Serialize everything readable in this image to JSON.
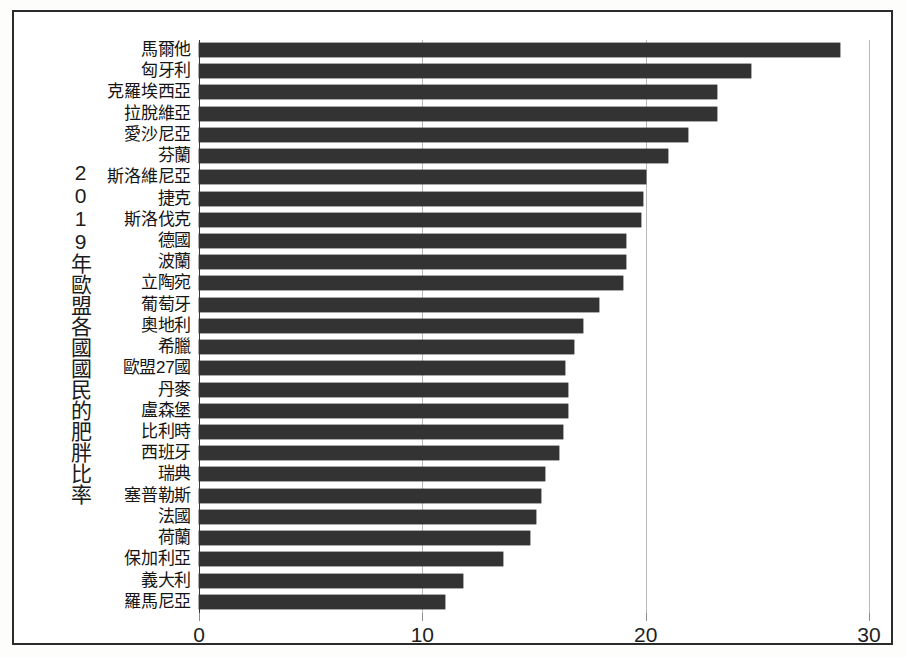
{
  "chart_data": {
    "type": "bar",
    "orientation": "horizontal",
    "title": "",
    "ylabel": "2019年歐盟各國國民的肥胖比率",
    "xlabel": "",
    "xlim": [
      0,
      30
    ],
    "xticks": [
      0,
      10,
      20,
      30
    ],
    "xtick_labels": [
      "0",
      "10",
      "20",
      "30"
    ],
    "grid": true,
    "grid_axis": "x",
    "legend": false,
    "bar_color": "#333333",
    "categories": [
      "馬爾他",
      "匈牙利",
      "克羅埃西亞",
      "拉脫維亞",
      "愛沙尼亞",
      "芬蘭",
      "斯洛維尼亞",
      "捷克",
      "斯洛伐克",
      "德國",
      "波蘭",
      "立陶宛",
      "葡萄牙",
      "奧地利",
      "希臘",
      "歐盟27國",
      "丹麥",
      "盧森堡",
      "比利時",
      "西班牙",
      "瑞典",
      "塞普勒斯",
      "法國",
      "荷蘭",
      "保加利亞",
      "義大利",
      "羅馬尼亞"
    ],
    "values": [
      28.7,
      24.7,
      23.2,
      23.2,
      21.9,
      21.0,
      20.0,
      19.9,
      19.8,
      19.1,
      19.1,
      19.0,
      17.9,
      17.2,
      16.8,
      16.4,
      16.5,
      16.5,
      16.3,
      16.1,
      15.5,
      15.3,
      15.1,
      14.8,
      13.6,
      11.8,
      11.0
    ]
  },
  "scan": {
    "bottom_artifact": ""
  }
}
